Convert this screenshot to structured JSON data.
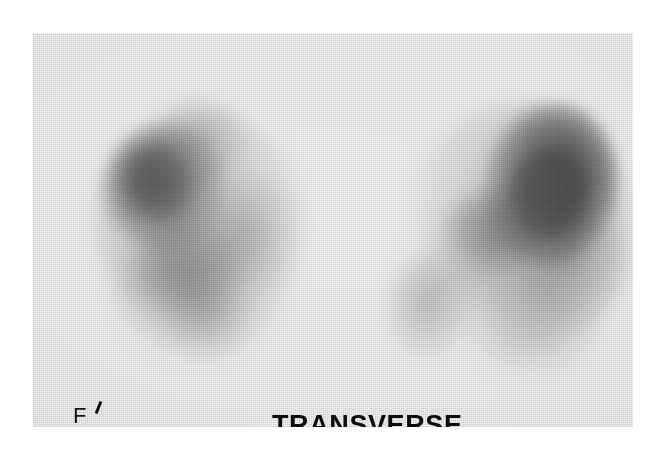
{
  "study": {
    "modality_description": "nuclear-medicine-scintigram",
    "plane_label": "TRANSVERSE",
    "orientation_marker": "F",
    "orientation_marker_meaning": "feet-marker",
    "background_color": "#f2f2f2",
    "annotation_color": "#0d0d0d",
    "page_background": "#ffffff"
  },
  "chart_data": {
    "type": "heatmap",
    "title": "TRANSVERSE",
    "xlabel": "",
    "ylabel": "",
    "colormap": "grayscale-inverted",
    "colormap_low": "#f2f2f2",
    "colormap_high": "#060606",
    "grid": false,
    "legend_position": "none",
    "annotations": [
      {
        "text": "F",
        "x": 40,
        "y": 372,
        "role": "orientation-marker"
      },
      {
        "text": "TRANSVERSE",
        "x": 239,
        "y": 379,
        "role": "plane-label"
      }
    ],
    "regions": [
      {
        "name": "left-kidney",
        "side": "image-left",
        "center_x": 168,
        "center_y": 205,
        "peak_intensity": 0.86,
        "peak_gray": "#181818",
        "features": [
          {
            "name": "upper-pole-hot-focus",
            "x": 130,
            "y": 175,
            "intensity": 0.9,
            "gray": "#181818"
          },
          {
            "name": "upper-tail",
            "x": 200,
            "y": 140,
            "intensity": 0.5,
            "gray": "#585858"
          },
          {
            "name": "medial-band",
            "x": 253,
            "y": 231,
            "intensity": 0.52,
            "gray": "#606060"
          },
          {
            "name": "lower-pole",
            "x": 205,
            "y": 285,
            "intensity": 0.56,
            "gray": "#565656"
          },
          {
            "name": "inferior-foot",
            "x": 207,
            "y": 320,
            "intensity": 0.42,
            "gray": "#646464"
          }
        ]
      },
      {
        "name": "right-kidney",
        "side": "image-right",
        "center_x": 495,
        "center_y": 205,
        "peak_intensity": 0.98,
        "peak_gray": "#060606",
        "features": [
          {
            "name": "upper-pole-intense-focus",
            "x": 551,
            "y": 184,
            "intensity": 0.98,
            "gray": "#060606"
          },
          {
            "name": "lateral-rim",
            "x": 575,
            "y": 268,
            "intensity": 0.46,
            "gray": "#505050"
          },
          {
            "name": "mid-band",
            "x": 506,
            "y": 251,
            "intensity": 0.54,
            "gray": "#4e4e4e"
          },
          {
            "name": "lower-pole",
            "x": 428,
            "y": 307,
            "intensity": 0.5,
            "gray": "#545454"
          },
          {
            "name": "inferior-tail",
            "x": 538,
            "y": 331,
            "intensity": 0.36,
            "gray": "#6e6e6e"
          }
        ]
      },
      {
        "name": "midline-gap",
        "side": "center",
        "center_x": 332,
        "center_y": 225,
        "peak_intensity": 0.04,
        "peak_gray": "#f0f0f0",
        "features": []
      }
    ],
    "intensity_scale": {
      "min": 0,
      "max": 1,
      "unit": "relative-tracer-uptake"
    }
  }
}
